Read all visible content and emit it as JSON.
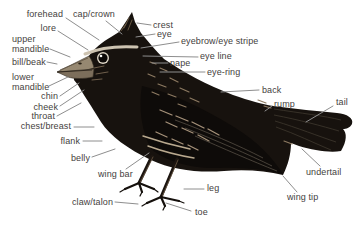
{
  "diagram_type": "bird-anatomy",
  "labels": {
    "forehead": "forehead",
    "cap_crown": "cap/crown",
    "lore": "lore",
    "upper_mandible": "upper mandible",
    "bill_beak": "bill/beak",
    "lower_mandible": "lower mandible",
    "chin": "chin",
    "cheek": "cheek",
    "throat": "throat",
    "chest_breast": "chest/breast",
    "flank": "flank",
    "belly": "belly",
    "wing_bar": "wing bar",
    "claw_talon": "claw/talon",
    "crest": "crest",
    "eye": "eye",
    "eyebrow_eye_stripe": "eyebrow/eye stripe",
    "eye_line": "eye line",
    "nape": "nape",
    "eye_ring": "eye-ring",
    "back": "back",
    "rump": "rump",
    "tail": "tail",
    "undertail": "undertail",
    "wing_tip": "wing tip",
    "leg": "leg",
    "toe": "toe"
  },
  "colors": {
    "background": "#ffffff",
    "label_text": "#45413d",
    "leader_line": "#8e8e8e",
    "bird_body": "#17120e",
    "bird_wing": "#0e0b09",
    "beak": "#968871",
    "eye_ring_highlight": "#ddd5c6"
  }
}
